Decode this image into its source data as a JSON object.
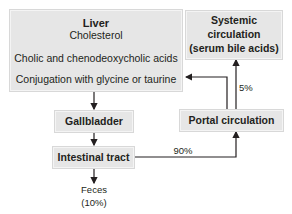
{
  "diagram": {
    "liver": {
      "title": "Liver",
      "step1": "Cholesterol",
      "step2": "Cholic and chenodeoxycholic acids",
      "step3": "Conjugation with glycine or taurine"
    },
    "systemic": {
      "line1": "Systemic",
      "line2": "circulation",
      "line3": "(serum bile acids)"
    },
    "gallbladder": "Gallbladder",
    "intestinal": "Intestinal tract",
    "portal": "Portal circulation",
    "feces": {
      "line1": "Feces",
      "line2": "(10%)"
    },
    "labels": {
      "to_portal": "90%",
      "to_systemic": "5%"
    },
    "colors": {
      "box_fill": "#e6e6e6",
      "line": "#231f20",
      "text": "#231f20"
    }
  }
}
